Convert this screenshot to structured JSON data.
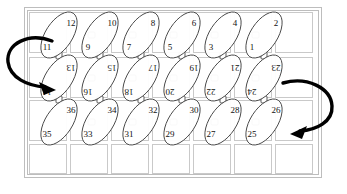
{
  "figure": {
    "colors": {
      "grid": "#c9c9c9",
      "frame": "#bdbdbd",
      "ellipse_stroke": "#4a4a4a",
      "ellipse_fill": "#ffffff",
      "label": "#111111",
      "arrow": "#000000"
    }
  },
  "background_grid": {
    "columns": 7,
    "rows": 4,
    "frame": {
      "x": 24,
      "y": 7,
      "width": 298,
      "height": 171
    }
  },
  "ellipse_rows": [
    {
      "row_index": 0,
      "orientation": "upright",
      "cells": [
        {
          "low": "11",
          "high": "12"
        },
        {
          "low": "9",
          "high": "10"
        },
        {
          "low": "7",
          "high": "8"
        },
        {
          "low": "5",
          "high": "6"
        },
        {
          "low": "3",
          "high": "4"
        },
        {
          "low": "1",
          "high": "2"
        }
      ]
    },
    {
      "row_index": 1,
      "orientation": "rotated-180",
      "cells": [
        {
          "low": "13",
          "high": "14"
        },
        {
          "low": "15",
          "high": "16"
        },
        {
          "low": "17",
          "high": "18"
        },
        {
          "low": "19",
          "high": "20"
        },
        {
          "low": "21",
          "high": "22"
        },
        {
          "low": "23",
          "high": "24"
        }
      ]
    },
    {
      "row_index": 2,
      "orientation": "upright",
      "cells": [
        {
          "low": "35",
          "high": "36"
        },
        {
          "low": "33",
          "high": "34"
        },
        {
          "low": "31",
          "high": "32"
        },
        {
          "low": "29",
          "high": "30"
        },
        {
          "low": "27",
          "high": "28"
        },
        {
          "low": "25",
          "high": "26"
        }
      ]
    }
  ],
  "arrows": [
    {
      "id": "left-turn-arrow",
      "name": "arrow-left-turnaround",
      "from": "11",
      "to": "14",
      "direction": "counterclockwise"
    },
    {
      "id": "right-turn-arrow",
      "name": "arrow-right-turnaround",
      "from": "23",
      "to": "26",
      "direction": "clockwise"
    }
  ]
}
